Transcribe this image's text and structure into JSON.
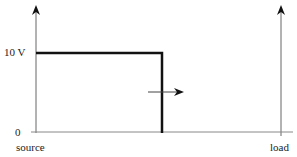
{
  "diagram": {
    "type": "voltage-step-transmission-line",
    "y_label_high": "10 V",
    "y_label_zero": "0",
    "x_label_left": "source",
    "x_label_right": "load",
    "step_voltage": 10,
    "wavefront_direction": "right",
    "colors": {
      "axis": "#555555",
      "signal": "#111111",
      "arrow": "#222222"
    }
  }
}
